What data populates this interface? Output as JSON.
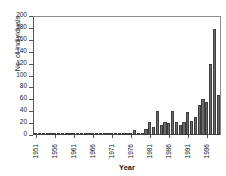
{
  "chart_data": {
    "type": "bar",
    "title": "",
    "xlabel": "Year",
    "ylabel": "No. of Individuals",
    "ylim": [
      0,
      200
    ],
    "ytick_step": 20,
    "yticks": [
      0,
      20,
      40,
      60,
      80,
      100,
      120,
      140,
      160,
      180,
      200
    ],
    "xtick_labels": [
      "1951",
      "1956",
      "1961",
      "1966",
      "1971",
      "1976",
      "1981",
      "1986",
      "1991",
      "1996"
    ],
    "xtick_step": 5,
    "grid": false,
    "legend": false,
    "bar_color": "#6b6b6b",
    "bar_edge_color": "#3d3d3d",
    "categories": [
      "1951",
      "1952",
      "1953",
      "1954",
      "1955",
      "1956",
      "1957",
      "1958",
      "1959",
      "1960",
      "1961",
      "1962",
      "1963",
      "1964",
      "1965",
      "1966",
      "1967",
      "1968",
      "1969",
      "1970",
      "1971",
      "1972",
      "1973",
      "1974",
      "1975",
      "1976",
      "1977",
      "1978",
      "1979",
      "1980",
      "1981",
      "1982",
      "1983",
      "1984",
      "1985",
      "1986",
      "1987",
      "1988",
      "1989",
      "1990",
      "1991",
      "1992",
      "1993",
      "1994",
      "1995",
      "1996",
      "1997",
      "1998",
      "1999"
    ],
    "values": [
      1,
      0,
      0,
      1,
      0,
      1,
      0,
      1,
      0,
      0,
      1,
      0,
      1,
      0,
      2,
      1,
      1,
      0,
      1,
      1,
      2,
      1,
      2,
      2,
      3,
      2,
      8,
      3,
      4,
      10,
      22,
      14,
      40,
      16,
      22,
      20,
      40,
      22,
      16,
      22,
      38,
      24,
      30,
      50,
      60,
      56,
      120,
      178,
      68
    ]
  }
}
